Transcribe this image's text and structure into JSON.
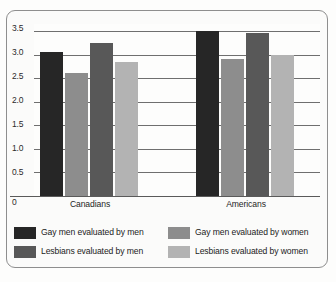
{
  "chart_data": {
    "type": "bar",
    "title": "",
    "subtitle": "",
    "xlabel": "",
    "ylabel": "",
    "categories": [
      "Canadians",
      "Americans"
    ],
    "series": [
      {
        "name": "Gay men evaluated by men",
        "color": "#262626",
        "values": [
          3.05,
          3.5
        ]
      },
      {
        "name": "Lesbians evaluated by men",
        "color": "#585858",
        "values": [
          3.25,
          3.45
        ]
      },
      {
        "name": "Gay men evaluated by women",
        "color": "#8d8d8d",
        "values": [
          2.6,
          2.9
        ]
      },
      {
        "name": "Lesbians evaluated by women",
        "color": "#b3b3b3",
        "values": [
          2.85,
          3.0
        ]
      }
    ],
    "bar_order": [
      "Gay men evaluated by men",
      "Gay men evaluated by women",
      "Lesbians evaluated by men",
      "Lesbians evaluated by women"
    ],
    "ylim": [
      0,
      3.65
    ],
    "yticks": [
      "3.5",
      "3.0",
      "2.5",
      "2.0",
      "1.5",
      "1.0",
      "0.5",
      "0"
    ],
    "ytick_values": [
      3.5,
      3.0,
      2.5,
      2.0,
      1.5,
      1.0,
      0.5,
      0
    ],
    "grid": true,
    "grid_axis": "y",
    "legend_position": "bottom",
    "legend_columns": 2
  },
  "legend": {
    "entries": [
      {
        "label": "Gay men evaluated by men",
        "swatch": "c0"
      },
      {
        "label": "Lesbians evaluated by men",
        "swatch": "c2"
      },
      {
        "label": "Gay men evaluated by women",
        "swatch": "c1"
      },
      {
        "label": "Lesbians evaluated by women",
        "swatch": "c3"
      }
    ]
  }
}
